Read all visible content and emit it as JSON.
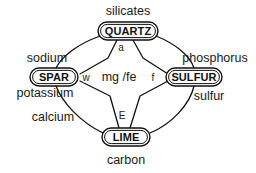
{
  "diagram": {
    "type": "node-link",
    "background_color": "#ffffff",
    "stroke_color": "#111111",
    "text_color": "#1a1a1a",
    "nodes": [
      {
        "id": "quartz",
        "label": "QUARTZ",
        "position": "top",
        "cx": 128,
        "cy": 31,
        "rx": 30,
        "ry": 9
      },
      {
        "id": "spar",
        "label": "SPAR",
        "position": "left",
        "cx": 54,
        "cy": 77,
        "rx": 24,
        "ry": 9
      },
      {
        "id": "sulfur",
        "label": "SULFUR",
        "position": "right",
        "cx": 194,
        "cy": 77,
        "rx": 28,
        "ry": 9
      },
      {
        "id": "lime",
        "label": "LIME",
        "position": "bottom",
        "cx": 126,
        "cy": 137,
        "rx": 24,
        "ry": 9
      }
    ],
    "outer_labels": [
      {
        "id": "silicates",
        "text": "silicates",
        "x": 128,
        "y": 15,
        "anchor": "middle",
        "near": "quartz"
      },
      {
        "id": "sodium",
        "text": "sodium",
        "x": 47,
        "y": 62,
        "anchor": "middle",
        "near": "spar"
      },
      {
        "id": "potassium",
        "text": "potassium",
        "x": 45,
        "y": 96,
        "anchor": "middle",
        "near": "spar"
      },
      {
        "id": "calcium",
        "text": "calcium",
        "x": 53,
        "y": 121,
        "anchor": "middle",
        "near": "spar-lime"
      },
      {
        "id": "phosphorus",
        "text": "phosphorus",
        "x": 215,
        "y": 62,
        "anchor": "middle",
        "near": "sulfur"
      },
      {
        "id": "sulfur-low",
        "text": "sulfur",
        "x": 209,
        "y": 99,
        "anchor": "middle",
        "near": "sulfur"
      },
      {
        "id": "carbon",
        "text": "carbon",
        "x": 126,
        "y": 163,
        "anchor": "middle",
        "near": "lime"
      }
    ],
    "edge_labels": [
      {
        "id": "a",
        "text": "a",
        "x": 121,
        "y": 51,
        "anchor": "middle"
      },
      {
        "id": "w",
        "text": "w",
        "x": 86,
        "y": 81,
        "anchor": "middle"
      },
      {
        "id": "f",
        "text": "f",
        "x": 153,
        "y": 81,
        "anchor": "middle"
      },
      {
        "id": "E",
        "text": "E",
        "x": 122,
        "y": 119,
        "anchor": "middle"
      }
    ],
    "center_label": {
      "id": "mgfe",
      "text": "mg /fe",
      "x": 119,
      "y": 81
    },
    "edges": [
      {
        "id": "outer-quartz-spar",
        "kind": "arc",
        "from": "quartz",
        "to": "spar"
      },
      {
        "id": "outer-quartz-sulfur",
        "kind": "arc",
        "from": "quartz",
        "to": "sulfur"
      },
      {
        "id": "outer-spar-lime",
        "kind": "arc",
        "from": "spar",
        "to": "lime"
      },
      {
        "id": "outer-sulfur-lime",
        "kind": "arc",
        "from": "sulfur",
        "to": "lime"
      },
      {
        "id": "inner-quartz-spar",
        "kind": "straight",
        "from": "quartz",
        "to": "spar"
      },
      {
        "id": "inner-quartz-sulfur",
        "kind": "straight",
        "from": "quartz",
        "to": "sulfur"
      },
      {
        "id": "inner-spar-lime",
        "kind": "straight",
        "from": "spar",
        "to": "lime"
      },
      {
        "id": "inner-sulfur-lime",
        "kind": "straight",
        "from": "sulfur",
        "to": "lime"
      }
    ]
  }
}
